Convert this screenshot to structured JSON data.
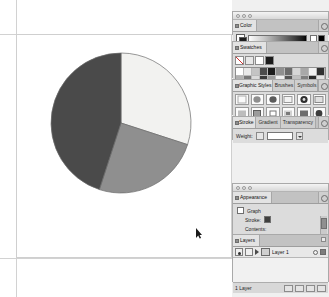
{
  "app": {
    "name": "Adobe Illustrator",
    "document_background": "#ffffff"
  },
  "canvas": {
    "artboard_label": "artboard",
    "cursor": "selection-arrow-cursor"
  },
  "chart_data": {
    "type": "pie",
    "title": "",
    "categories": [
      "Slice 1",
      "Slice 2",
      "Slice 3"
    ],
    "values": [
      30,
      25,
      45
    ],
    "start_angle_deg": 0,
    "direction": "clockwise",
    "colors": [
      "#f2f2f0",
      "#8f8f8f",
      "#4a4a4a"
    ],
    "stroke": "#6b6b6b",
    "legend": "none",
    "labels_shown": false,
    "center": {
      "x": 76,
      "y": 71
    },
    "radius": 70
  },
  "dock": {
    "color_panel": {
      "tabs": [
        {
          "label": "Color",
          "active": true
        }
      ],
      "menu_icon": "panel-menu-icon",
      "fill_swatch": "#ffffff",
      "stroke_swatch": "#1d1d1d",
      "ramp": "grayscale-ramp",
      "end_swatches": [
        "#ffffff",
        "#000000"
      ]
    },
    "swatches_panel": {
      "tabs": [
        {
          "label": "Swatches",
          "active": true
        }
      ],
      "menu_icon": "panel-menu-icon",
      "tool_icons": [
        "none-swatch-icon",
        "registration-icon",
        "white-swatch-icon",
        "black-swatch-icon"
      ],
      "swatch_rows": [
        [
          "#ffffff",
          "#e8e8e8",
          "#c4c4c4",
          "#4c4c4c",
          "#1c1c1c",
          "#8f8f8f",
          "#6b6b6b",
          "#d6d6d6",
          "#a8a8a8",
          "#f0f0f0",
          "#303030"
        ],
        [
          "#b0b0b0",
          "#777777",
          "#dadada",
          "#3a3a3a",
          "#9c9c9c",
          "#efefef",
          "#555555",
          "#c0c0c0",
          "#7e7e7e",
          "#2a2a2a",
          "#e3e3e3"
        ],
        [
          "#cfcfcf",
          "#4e4e4e",
          "#a0a0a0",
          "#f5f5f5",
          "#6a6a6a",
          "#8a8a8a",
          "#232323",
          "#d2d2d2",
          "#b6b6b6",
          "#5c5c5c",
          "#9a9a9a"
        ],
        [
          "#5f5f5f",
          "#ededed",
          "#8c8c8c",
          "#262626",
          "#b8b8b8",
          "#717171",
          "#d9d9d9",
          "#404040",
          "#a4a4a4",
          "#efefef",
          "#636363"
        ]
      ],
      "footer_buttons": [
        "new-swatch-button",
        "delete-swatch-button"
      ]
    },
    "styles_panel": {
      "tabs": [
        {
          "label": "Graphic Styles",
          "active": true
        },
        {
          "label": "Brushes",
          "active": false
        },
        {
          "label": "Symbols",
          "active": false
        }
      ],
      "menu_icon": "panel-menu-icon",
      "footer_buttons": [
        "break-link-button",
        "new-style-button",
        "delete-style-button"
      ]
    },
    "stroke_panel": {
      "tabs": [
        {
          "label": "Stroke",
          "active": true
        },
        {
          "label": "Gradient",
          "active": false
        },
        {
          "label": "Transparency",
          "active": false
        }
      ],
      "menu_icon": "panel-menu-icon",
      "weight_label": "Weight:",
      "weight_value": "1 pt"
    },
    "appearance_panel": {
      "tabs": [
        {
          "label": "Appearance",
          "active": true
        }
      ],
      "menu_icon": "panel-menu-icon",
      "target_label": "Graph",
      "rows": [
        {
          "label": "Stroke:",
          "swatch": "dark"
        },
        {
          "label": "Contents:",
          "swatch": "none"
        },
        {
          "label": "Fill:",
          "swatch": "white"
        }
      ],
      "footer_buttons": [
        "new-art-button",
        "clear-appearance-button",
        "reduce-to-basic-button",
        "duplicate-item-button",
        "delete-item-button"
      ]
    },
    "layers_panel": {
      "tabs": [
        {
          "label": "Layers",
          "active": true
        }
      ],
      "menu_icon": "panel-menu-icon",
      "close_icon": "close-icon",
      "layers": [
        {
          "name": "Layer 1",
          "visible": true,
          "locked": false,
          "selected": true
        }
      ],
      "status": "1 Layer",
      "footer_buttons": [
        "make-clipping-mask-button",
        "create-sublayer-button",
        "create-layer-button",
        "delete-layer-button"
      ]
    }
  }
}
